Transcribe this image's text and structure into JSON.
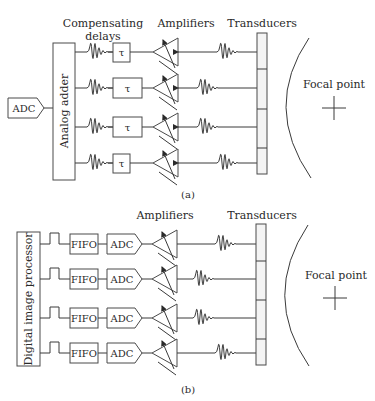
{
  "figure_a": {
    "caption": "(a)",
    "labels": {
      "compensating_delays_line1": "Compensating",
      "compensating_delays_line2": "delays",
      "amplifiers": "Amplifiers",
      "transducers": "Transducers",
      "focal_point": "Focal point",
      "analog_adder": "Analog adder",
      "adc": "ADC"
    },
    "rows": [
      {
        "delay_symbol": "τ"
      },
      {
        "delay_symbol": "τ"
      },
      {
        "delay_symbol": "τ"
      },
      {
        "delay_symbol": "τ"
      }
    ]
  },
  "figure_b": {
    "caption": "(b)",
    "labels": {
      "amplifiers": "Amplifiers",
      "transducers": "Transducers",
      "focal_point": "Focal point",
      "digital_image_processor": "Digital image processor"
    },
    "rows": [
      {
        "fifo": "FIFO",
        "adc": "ADC"
      },
      {
        "fifo": "FIFO",
        "adc": "ADC"
      },
      {
        "fifo": "FIFO",
        "adc": "ADC"
      },
      {
        "fifo": "FIFO",
        "adc": "ADC"
      }
    ]
  },
  "colors": {
    "line": "#3a3a3a",
    "transducer_fill": "#f4f4f4",
    "background": "#ffffff"
  }
}
